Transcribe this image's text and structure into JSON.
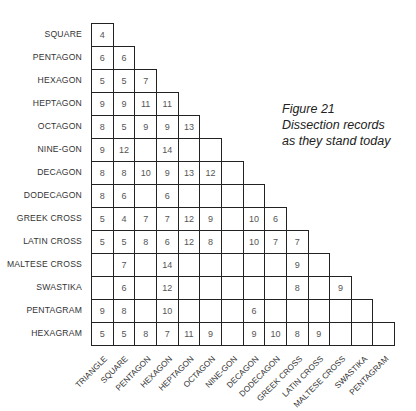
{
  "caption": {
    "line1": "Figure 21",
    "line2": "Dissection records",
    "line3": "as they stand today"
  },
  "chart_data": {
    "type": "table",
    "title": "Figure 21 Dissection records as they stand today",
    "row_labels": [
      "SQUARE",
      "PENTAGON",
      "HEXAGON",
      "HEPTAGON",
      "OCTAGON",
      "NINE-GON",
      "DECAGON",
      "DODECAGON",
      "GREEK CROSS",
      "LATIN CROSS",
      "MALTESE CROSS",
      "SWASTIKA",
      "PENTAGRAM",
      "HEXAGRAM"
    ],
    "col_labels": [
      "TRIANGLE",
      "SQUARE",
      "PENTAGON",
      "HEXAGON",
      "HEPTAGON",
      "OCTAGON",
      "NINE-GON",
      "DECAGON",
      "DODECAGON",
      "GREEK CROSS",
      "LATIN CROSS",
      "MALTESE CROSS",
      "SWASTIKA",
      "PENTAGRAM"
    ],
    "rows": [
      [
        "4"
      ],
      [
        "6",
        "6"
      ],
      [
        "5",
        "5",
        "7"
      ],
      [
        "9",
        "9",
        "11",
        "11"
      ],
      [
        "8",
        "5",
        "9",
        "9",
        "13"
      ],
      [
        "9",
        "12",
        "",
        "14",
        "",
        ""
      ],
      [
        "8",
        "8",
        "10",
        "9",
        "13",
        "12",
        ""
      ],
      [
        "8",
        "6",
        "",
        "6",
        "",
        "",
        "",
        ""
      ],
      [
        "5",
        "4",
        "7",
        "7",
        "12",
        "9",
        "",
        "10",
        "6"
      ],
      [
        "5",
        "5",
        "8",
        "6",
        "12",
        "8",
        "",
        "10",
        "7",
        "7"
      ],
      [
        "",
        "7",
        "",
        "14",
        "",
        "",
        "",
        "",
        "",
        "9",
        ""
      ],
      [
        "",
        "6",
        "",
        "12",
        "",
        "",
        "",
        "",
        "",
        "8",
        "",
        "9"
      ],
      [
        "9",
        "8",
        "",
        "10",
        "",
        "",
        "",
        "6",
        "",
        "",
        "",
        "",
        ""
      ],
      [
        "5",
        "5",
        "8",
        "7",
        "11",
        "9",
        "",
        "9",
        "10",
        "8",
        "9",
        "",
        "",
        ""
      ]
    ]
  }
}
